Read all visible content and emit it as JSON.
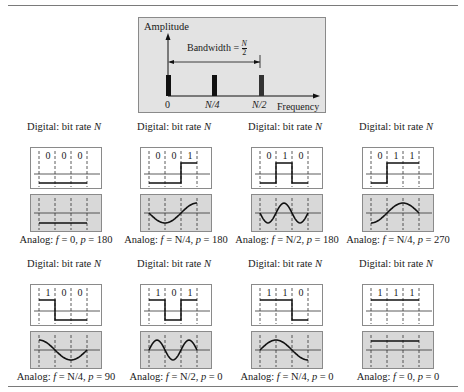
{
  "spectrum": {
    "y_label": "Amplitude",
    "x_label": "Frequency",
    "bandwidth_label": "Bandwidth = ",
    "bandwidth_num": "N",
    "bandwidth_den": "2",
    "ticks": [
      "0",
      "N/4",
      "N/2"
    ]
  },
  "chart_data": {
    "type": "bar",
    "xlabel": "Frequency",
    "ylabel": "Amplitude",
    "categories": [
      "0",
      "N/4",
      "N/2"
    ],
    "values": [
      1,
      1,
      1
    ],
    "annotation": "Bandwidth = N/2",
    "panels": [
      {
        "bits": [
          0,
          0,
          0
        ],
        "analog_f": "0",
        "analog_p": 180
      },
      {
        "bits": [
          0,
          0,
          1
        ],
        "analog_f": "N/4",
        "analog_p": 180
      },
      {
        "bits": [
          0,
          1,
          0
        ],
        "analog_f": "N/2",
        "analog_p": 180
      },
      {
        "bits": [
          0,
          1,
          1
        ],
        "analog_f": "N/4",
        "analog_p": 270
      },
      {
        "bits": [
          1,
          0,
          0
        ],
        "analog_f": "N/4",
        "analog_p": 90
      },
      {
        "bits": [
          1,
          0,
          1
        ],
        "analog_f": "N/2",
        "analog_p": 0
      },
      {
        "bits": [
          1,
          1,
          0
        ],
        "analog_f": "N/4",
        "analog_p": 0
      },
      {
        "bits": [
          1,
          1,
          1
        ],
        "analog_f": "0",
        "analog_p": 0
      }
    ]
  },
  "panels": [
    {
      "title": "Digital: bit rate ",
      "title_var": "N",
      "bits": [
        "0",
        "0",
        "0"
      ],
      "caption_prefix": "Analog: ",
      "caption_f": "f",
      "caption_rest": " = 0, ",
      "caption_p": "p",
      "caption_val": " = 180"
    },
    {
      "title": "Digital: bit rate ",
      "title_var": "N",
      "bits": [
        "0",
        "0",
        "1"
      ],
      "caption_prefix": "Analog: ",
      "caption_f": "f",
      "caption_rest": " = N/4, ",
      "caption_p": "p",
      "caption_val": " = 180"
    },
    {
      "title": "Digital: bit rate ",
      "title_var": "N",
      "bits": [
        "0",
        "1",
        "0"
      ],
      "caption_prefix": "Analog: ",
      "caption_f": "f",
      "caption_rest": " = N/2, ",
      "caption_p": "p",
      "caption_val": " = 180"
    },
    {
      "title": "Digital: bit rate ",
      "title_var": "N",
      "bits": [
        "0",
        "1",
        "1"
      ],
      "caption_prefix": "Analog: ",
      "caption_f": "f",
      "caption_rest": " = N/4, ",
      "caption_p": "p",
      "caption_val": " = 270"
    },
    {
      "title": "Digital: bit rate ",
      "title_var": "N",
      "bits": [
        "1",
        "0",
        "0"
      ],
      "caption_prefix": "Analog: ",
      "caption_f": "f",
      "caption_rest": " = N/4, ",
      "caption_p": "p",
      "caption_val": " = 90"
    },
    {
      "title": "Digital: bit rate ",
      "title_var": "N",
      "bits": [
        "1",
        "0",
        "1"
      ],
      "caption_prefix": "Analog: ",
      "caption_f": "f",
      "caption_rest": " = N/2, ",
      "caption_p": "p",
      "caption_val": " = 0"
    },
    {
      "title": "Digital: bit rate ",
      "title_var": "N",
      "bits": [
        "1",
        "1",
        "0"
      ],
      "caption_prefix": "Analog: ",
      "caption_f": "f",
      "caption_rest": " = N/4, ",
      "caption_p": "p",
      "caption_val": " = 0"
    },
    {
      "title": "Digital: bit rate ",
      "title_var": "N",
      "bits": [
        "1",
        "1",
        "1"
      ],
      "caption_prefix": "Analog: ",
      "caption_f": "f",
      "caption_rest": " = 0, ",
      "caption_p": "p",
      "caption_val": " = 0"
    }
  ]
}
